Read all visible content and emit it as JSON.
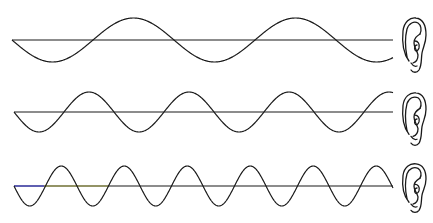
{
  "figure": {
    "stroke_color": "#1a1a1a",
    "axis_tint_colors": [
      "#3b3bd0",
      "#9a9a40"
    ],
    "waves": [
      {
        "name": "low-frequency-wave",
        "axis_y": 40,
        "x_start": 12,
        "x_end": 393,
        "amplitude": 22,
        "period": 162
      },
      {
        "name": "medium-frequency-wave",
        "axis_y": 112,
        "x_start": 14,
        "x_end": 393,
        "amplitude": 20,
        "period": 100
      },
      {
        "name": "high-frequency-wave",
        "axis_y": 186,
        "x_start": 14,
        "x_end": 393,
        "amplitude": 20,
        "period": 63
      }
    ],
    "ears": [
      {
        "name": "ear-icon-1",
        "x": 401,
        "y": 17,
        "w": 26,
        "h": 56
      },
      {
        "name": "ear-icon-2",
        "x": 401,
        "y": 92,
        "w": 26,
        "h": 54
      },
      {
        "name": "ear-icon-3",
        "x": 401,
        "y": 163,
        "w": 26,
        "h": 50
      }
    ]
  }
}
